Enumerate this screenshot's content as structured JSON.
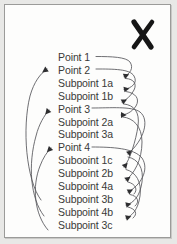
{
  "document": {
    "type": "scanned-outline-diagram",
    "description": "Scanned page showing a vertical outline list with curved arrows linking points to subpoints, marked with a hand-drawn X"
  },
  "marks": {
    "x_mark": "X"
  },
  "outline": {
    "items": [
      {
        "label": "Point 1",
        "level": "point",
        "has_leader": true,
        "has_arrowhead": false
      },
      {
        "label": "Point 2",
        "level": "point",
        "has_leader": true,
        "has_arrowhead": true
      },
      {
        "label": "Subpoint 1a",
        "level": "subpoint",
        "has_leader": false,
        "has_arrowhead": true
      },
      {
        "label": "Subpoint 1b",
        "level": "subpoint",
        "has_leader": false,
        "has_arrowhead": true
      },
      {
        "label": "Point 3",
        "level": "point",
        "has_leader": true,
        "has_arrowhead": true
      },
      {
        "label": "Subpoint 2a",
        "level": "subpoint",
        "has_leader": false,
        "has_arrowhead": true
      },
      {
        "label": "Subpoint 3a",
        "level": "subpoint",
        "has_leader": false,
        "has_arrowhead": true
      },
      {
        "label": "Point 4",
        "level": "point",
        "has_leader": true,
        "has_arrowhead": true
      },
      {
        "label": "Subooint 1c",
        "level": "subpoint",
        "has_leader": false,
        "has_arrowhead": true
      },
      {
        "label": "Subpoint 2b",
        "level": "subpoint",
        "has_leader": false,
        "has_arrowhead": true
      },
      {
        "label": "Subpoint 4a",
        "level": "subpoint",
        "has_leader": false,
        "has_arrowhead": true
      },
      {
        "label": "Subpoint 3b",
        "level": "subpoint",
        "has_leader": false,
        "has_arrowhead": true
      },
      {
        "label": "Subpoint 4b",
        "level": "subpoint",
        "has_leader": false,
        "has_arrowhead": true
      },
      {
        "label": "Subpoint 3c",
        "level": "subpoint",
        "has_leader": false,
        "has_arrowhead": true
      }
    ]
  },
  "colors": {
    "page_background": "#e8e8e6",
    "paper": "#fdfdfc",
    "frame_border": "#9b9b99",
    "text": "#3a3a38",
    "stroke": "#55555a",
    "mark": "#1a1a1a"
  },
  "layout": {
    "first_line_top": 52,
    "line_pitch": 12.9,
    "text_left": 58
  }
}
